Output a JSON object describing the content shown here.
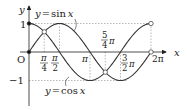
{
  "figure": {
    "curves": [
      {
        "name": "sine",
        "label": "y = sin x",
        "label_y": "y",
        "label_eq": "=",
        "label_fn": "sin",
        "label_x": "x",
        "color": "#333333"
      },
      {
        "name": "cosine",
        "label": "y = cos x",
        "label_y": "y",
        "label_eq": "=",
        "label_fn": "cos",
        "label_x": "x",
        "color": "#333333"
      }
    ],
    "axes": {
      "x_label": "x",
      "y_label": "y",
      "origin_label": "O",
      "x_range": [
        0,
        6.283
      ],
      "y_range": [
        -1,
        1
      ]
    },
    "y_ticks": [
      {
        "value": 1,
        "label": "1"
      },
      {
        "value": -1,
        "label": "−1"
      }
    ],
    "x_ticks": [
      {
        "value": 0.7854,
        "num": "π",
        "den": "4"
      },
      {
        "value": 1.5708,
        "num": "π",
        "den": "2"
      },
      {
        "value": 3.1416,
        "label": "π"
      },
      {
        "value": 3.927,
        "num": "5",
        "den": "4",
        "suffix": "π"
      },
      {
        "value": 4.7124,
        "num": "3",
        "den": "2",
        "suffix": "π"
      },
      {
        "value": 6.2832,
        "label": "2π"
      }
    ],
    "intersections": [
      {
        "x": 0.7854,
        "y": 0.7071
      },
      {
        "x": 3.927,
        "y": -0.7071
      }
    ],
    "endpoints": {
      "filled": [
        {
          "x": 0,
          "y": 0
        },
        {
          "x": 0,
          "y": 1
        }
      ],
      "open": [
        {
          "x": 6.2832,
          "y": 0
        },
        {
          "x": 6.2832,
          "y": 1
        }
      ]
    }
  }
}
